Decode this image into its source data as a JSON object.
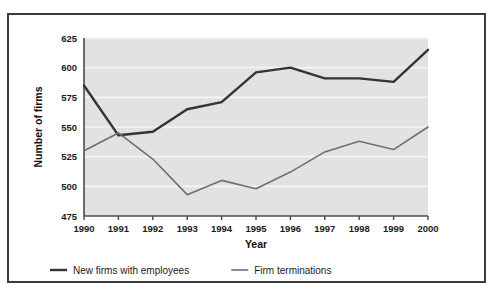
{
  "chart_data": {
    "type": "line",
    "title": "",
    "xlabel": "Year",
    "ylabel": "Number of firms",
    "categories": [
      1990,
      1991,
      1992,
      1993,
      1994,
      1995,
      1996,
      1997,
      1998,
      1999,
      2000
    ],
    "x": [
      "1990",
      "1991",
      "1992",
      "1993",
      "1994",
      "1995",
      "1996",
      "1997",
      "1998",
      "1999",
      "2000"
    ],
    "xlim": [
      1990,
      2000
    ],
    "ylim": [
      475,
      625
    ],
    "yticks": [
      "475",
      "500",
      "525",
      "550",
      "575",
      "600",
      "625"
    ],
    "ytick_values": [
      475,
      500,
      525,
      550,
      575,
      600,
      625
    ],
    "grid": "horizontal",
    "legend_position": "bottom-left",
    "plot_background": "#e2e2e2",
    "gridline_color": "#f4f4f4",
    "series": [
      {
        "name": "New firms with employees",
        "color": "#333338",
        "width": 2.4,
        "values": [
          585,
          543,
          546,
          565,
          571,
          596,
          600,
          591,
          591,
          588,
          615
        ]
      },
      {
        "name": "Firm terminations",
        "color": "#6e6e74",
        "width": 1.6,
        "values": [
          530,
          545,
          523,
          493,
          505,
          498,
          512,
          529,
          538,
          531,
          550
        ]
      }
    ]
  },
  "legend": {
    "items": [
      {
        "label": "New firms with employees",
        "color": "#333338",
        "width": 2.4
      },
      {
        "label": "Firm terminations",
        "color": "#6e6e74",
        "width": 1.6
      }
    ]
  },
  "axes": {
    "y_title": "Number of firms",
    "x_title": "Year"
  },
  "colors": {
    "frame": "#3a3a42",
    "plot_bg": "#e2e2e2",
    "grid": "#f4f4f4",
    "axis": "#4a4a50",
    "text": "#1b1b1b",
    "series_primary": "#333338",
    "series_secondary": "#6e6e74"
  }
}
